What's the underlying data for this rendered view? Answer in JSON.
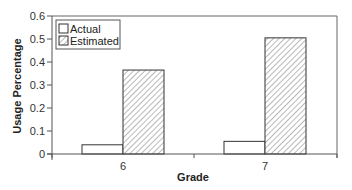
{
  "chart_data": {
    "type": "bar",
    "title": "",
    "xlabel": "Grade",
    "ylabel": "Usage Percentage",
    "categories": [
      "6",
      "7"
    ],
    "series": [
      {
        "name": "Actual",
        "values": [
          0.04,
          0.055
        ],
        "fill": "plain"
      },
      {
        "name": "Estimated",
        "values": [
          0.365,
          0.505
        ],
        "fill": "hatched"
      }
    ],
    "ylim": [
      0,
      0.6
    ],
    "yticks": [
      "0",
      "0.1",
      "0.2",
      "0.3",
      "0.4",
      "0.5",
      "0.6"
    ],
    "grid": false,
    "legend_position": "upper-left"
  },
  "legend": {
    "items": [
      {
        "label": "Actual"
      },
      {
        "label": "Estimated"
      }
    ]
  },
  "axes": {
    "xlabel": "Grade",
    "ylabel": "Usage Percentage"
  },
  "colors": {
    "axis": "#555555",
    "bar_edge": "#333333",
    "hatch": "#8a8a8a",
    "background": "#ffffff"
  }
}
